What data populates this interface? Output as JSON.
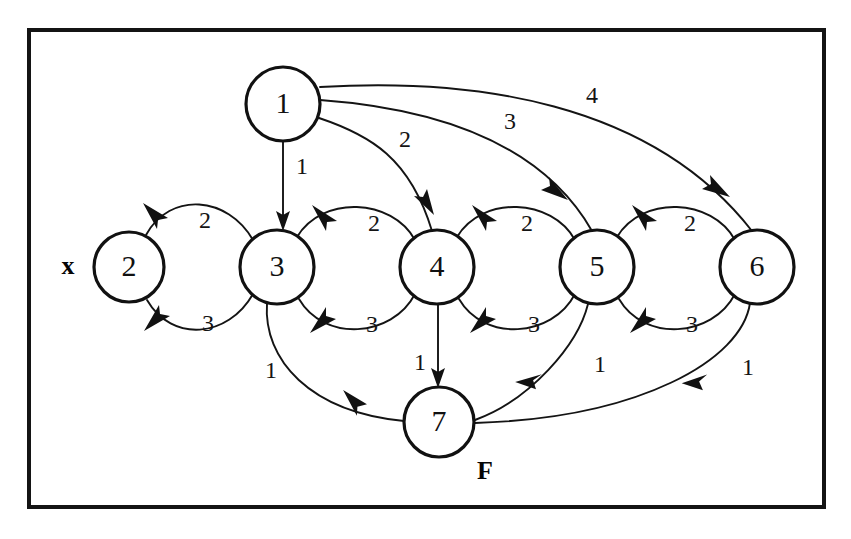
{
  "figure": {
    "background_color": "#ffffff",
    "frame": {
      "stroke_color": "#141414",
      "x": 27,
      "y": 28,
      "width": 799,
      "height": 481
    }
  },
  "nodes": [
    {
      "id": "1",
      "label": "1",
      "cx": 283,
      "cy": 104,
      "r": 37
    },
    {
      "id": "2",
      "label": "2",
      "cx": 129,
      "cy": 267,
      "r": 35
    },
    {
      "id": "3",
      "label": "3",
      "cx": 277,
      "cy": 267,
      "r": 37
    },
    {
      "id": "4",
      "label": "4",
      "cx": 437,
      "cy": 267,
      "r": 37
    },
    {
      "id": "5",
      "label": "5",
      "cx": 597,
      "cy": 267,
      "r": 37
    },
    {
      "id": "6",
      "label": "6",
      "cx": 757,
      "cy": 267,
      "r": 37
    },
    {
      "id": "7",
      "label": "7",
      "cx": 439,
      "cy": 422,
      "r": 35
    }
  ],
  "markers": [
    {
      "id": "start-marker",
      "label": "x",
      "x": 68,
      "y": 267,
      "note": "start state marker beside node 2"
    },
    {
      "id": "final-marker",
      "label": "F",
      "x": 485,
      "y": 473,
      "note": "final state marker beside node 7"
    }
  ],
  "edges": [
    {
      "id": "e1-3",
      "from": "1",
      "to": "3",
      "label": "1",
      "label_x": 302,
      "label_y": 168,
      "shape": "straight-down"
    },
    {
      "id": "e1-4",
      "from": "1",
      "to": "4",
      "label": "2",
      "label_x": 405,
      "label_y": 141,
      "shape": "long-arc"
    },
    {
      "id": "e1-5",
      "from": "1",
      "to": "5",
      "label": "3",
      "label_x": 510,
      "label_y": 123,
      "shape": "long-arc"
    },
    {
      "id": "e1-6",
      "from": "1",
      "to": "6",
      "label": "4",
      "label_x": 592,
      "label_y": 97,
      "shape": "long-arc"
    },
    {
      "id": "e3-2-upper",
      "from": "3",
      "to": "2",
      "label": "2",
      "label_x": 205,
      "label_y": 222,
      "shape": "arc-above"
    },
    {
      "id": "e3-2-lower",
      "from": "3",
      "to": "2",
      "label": "3",
      "label_x": 208,
      "label_y": 325,
      "shape": "arc-below"
    },
    {
      "id": "e4-3-upper",
      "from": "4",
      "to": "3",
      "label": "2",
      "label_x": 374,
      "label_y": 225,
      "shape": "arc-above"
    },
    {
      "id": "e4-3-lower",
      "from": "4",
      "to": "3",
      "label": "3",
      "label_x": 372,
      "label_y": 326,
      "shape": "arc-below"
    },
    {
      "id": "e5-4-upper",
      "from": "5",
      "to": "4",
      "label": "2",
      "label_x": 527,
      "label_y": 225,
      "shape": "arc-above"
    },
    {
      "id": "e5-4-lower",
      "from": "5",
      "to": "4",
      "label": "3",
      "label_x": 534,
      "label_y": 326,
      "shape": "arc-below"
    },
    {
      "id": "e6-5-upper",
      "from": "6",
      "to": "5",
      "label": "2",
      "label_x": 690,
      "label_y": 225,
      "shape": "arc-above"
    },
    {
      "id": "e6-5-lower",
      "from": "6",
      "to": "5",
      "label": "3",
      "label_x": 692,
      "label_y": 326,
      "shape": "arc-below"
    },
    {
      "id": "e3-7",
      "from": "3",
      "to": "7",
      "label": "1",
      "label_x": 271,
      "label_y": 372,
      "shape": "arc-down-right"
    },
    {
      "id": "e4-7",
      "from": "4",
      "to": "7",
      "label": "1",
      "label_x": 420,
      "label_y": 364,
      "shape": "straight-down"
    },
    {
      "id": "e5-7",
      "from": "5",
      "to": "7",
      "label": "1",
      "label_x": 600,
      "label_y": 366,
      "shape": "arc-down-left"
    },
    {
      "id": "e6-7",
      "from": "6",
      "to": "7",
      "label": "1",
      "label_x": 748,
      "label_y": 369,
      "shape": "arc-down-left"
    }
  ]
}
